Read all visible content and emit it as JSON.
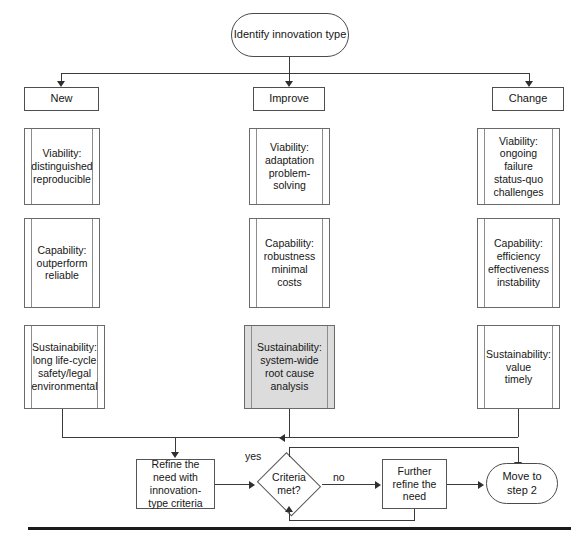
{
  "diagram": {
    "type": "flowchart",
    "title_node": "Identify innovation type",
    "branches": [
      {
        "key": "new",
        "label": "New"
      },
      {
        "key": "improve",
        "label": "Improve"
      },
      {
        "key": "change",
        "label": "Change"
      }
    ],
    "criteria_rows": [
      "Viability",
      "Capability",
      "Sustainability"
    ],
    "cards": {
      "new": {
        "viability": "Viability:\ndistinguished\nreproducible",
        "capability": "Capability:\noutperform\nreliable",
        "sustainability": "Sustainability:\nlong life-cycle\nsafety/legal\nenvironmental"
      },
      "improve": {
        "viability": "Viability:\nadaptation\nproblem-\nsolving",
        "capability": "Capability:\nrobustness\nminimal\ncosts",
        "sustainability": "Sustainability:\nsystem-wide\nroot cause\nanalysis"
      },
      "change": {
        "viability": "Viability:\nongoing\nfailure\nstatus-quo\nchallenges",
        "capability": "Capability:\nefficiency\neffectiveness\ninstability",
        "sustainability": "Sustainability:\nvalue\ntimely"
      }
    },
    "highlighted_card": "improve.sustainability",
    "highlight_color": "#dcdcdc",
    "bottom_flow": {
      "refine": "Refine the\nneed with\ninnovation-\ntype criteria",
      "decision": "Criteria\nmet?",
      "further_refine": "Further\nrefine the\nneed",
      "move": "Move to\nstep 2",
      "label_yes": "yes",
      "label_no": "no"
    },
    "line_color": "#3a3a3a",
    "box_border_color": "#5c5c5c"
  }
}
